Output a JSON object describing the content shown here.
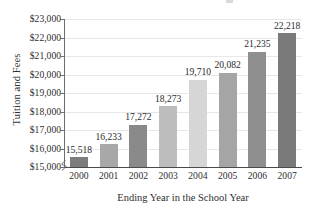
{
  "chart_data": {
    "type": "bar",
    "title": "",
    "xlabel": "Ending Year in the School Year",
    "ylabel": "Tuition and Fees",
    "categories": [
      "2000",
      "2001",
      "2002",
      "2003",
      "2004",
      "2005",
      "2006",
      "2007"
    ],
    "values": [
      15518,
      16233,
      17272,
      18273,
      19710,
      20082,
      21235,
      22218
    ],
    "value_labels": [
      "15,518",
      "16,233",
      "17,272",
      "18,273",
      "19,710",
      "20,082",
      "21,235",
      "22,218"
    ],
    "ylim": [
      15000,
      23000
    ],
    "ytick_values": [
      15000,
      16000,
      17000,
      18000,
      19000,
      20000,
      21000,
      22000,
      23000
    ],
    "ytick_labels": [
      "$15,000",
      "$16,000",
      "$17,000",
      "$18,000",
      "$19,000",
      "$20,000",
      "$21,000",
      "$22,000",
      "$23,000"
    ],
    "grid": true,
    "legend": null,
    "axis_break": true,
    "bar_colors": [
      "#7c7c7c",
      "#a8a8a8",
      "#8a8a8a",
      "#bdbdbd",
      "#d6d6d6",
      "#a5a5a5",
      "#8f8f8f",
      "#7a7a7a"
    ]
  },
  "axes": {
    "y_title": "Tuition and Fees",
    "x_title": "Ending Year in the School Year"
  },
  "colors": {
    "gridline": "#e7e7e7",
    "axis": "#6e6e6e",
    "text": "#2f2f2f"
  }
}
